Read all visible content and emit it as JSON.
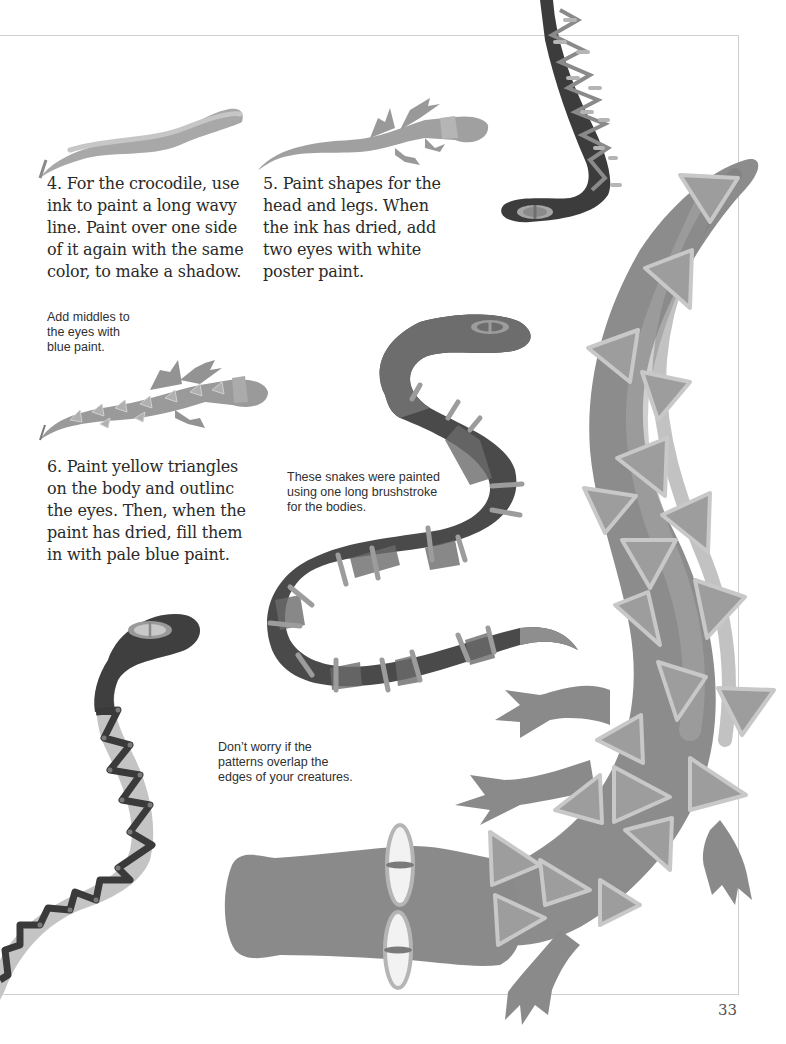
{
  "page": {
    "number": "33",
    "colors": {
      "text": "#2a2a2a",
      "frame": "#cfcfcf",
      "snake_dark": "#3c3c3c",
      "snake_mid": "#666666",
      "croc_body": "#8f8f8f",
      "triangle_fill": "#9c9c9c",
      "triangle_outline": "#c6c6c6"
    }
  },
  "steps": [
    {
      "id": "step-4",
      "lines": [
        "4. For the crocodile, use",
        "ink to paint a long wavy",
        "line. Paint over one side",
        "of it again with the same",
        "color, to make a shadow."
      ]
    },
    {
      "id": "step-5",
      "lines": [
        "5. Paint shapes for the",
        "head and legs. When",
        "the ink has dried, add",
        "two eyes with white",
        "poster paint."
      ]
    },
    {
      "id": "step-6",
      "lines": [
        "6. Paint yellow triangles",
        "on the body and outlinc",
        "the eyes. Then, when the",
        "paint has dried, fill them",
        "in with pale blue paint."
      ]
    }
  ],
  "captions": [
    {
      "id": "eyes-tip",
      "lines": [
        "Add middles to",
        "the eyes with",
        "blue paint."
      ]
    },
    {
      "id": "snakes-tip",
      "lines": [
        "These snakes were painted",
        "using one long brushstroke",
        "for the bodies."
      ]
    },
    {
      "id": "patterns-tip",
      "lines": [
        "Don’t worry if the",
        "patterns overlap the",
        "edges of your creatures."
      ]
    }
  ],
  "illustrations": [
    {
      "name": "wavy-line-stroke-illustration"
    },
    {
      "name": "crocodile-head-legs-illustration"
    },
    {
      "name": "crocodile-triangles-illustration"
    },
    {
      "name": "snake-top-zigzag-illustration"
    },
    {
      "name": "snake-middle-banded-illustration"
    },
    {
      "name": "snake-left-zigzag-illustration"
    },
    {
      "name": "large-crocodile-illustration"
    }
  ]
}
